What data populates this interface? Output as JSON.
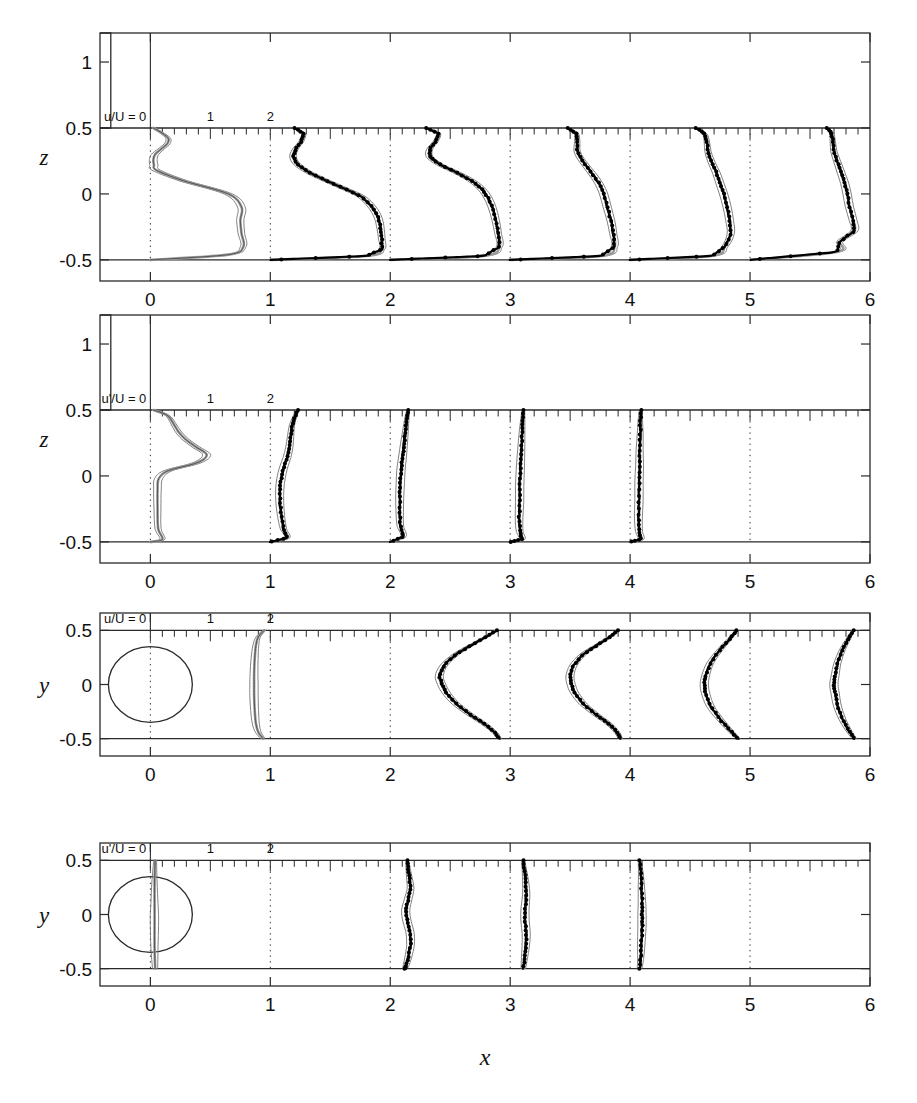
{
  "figure": {
    "title": "",
    "xlabel": "x",
    "x_axis": {
      "min": -0.42,
      "max": 6.0,
      "ticks": [
        0,
        1,
        2,
        3,
        4,
        5,
        6
      ],
      "tick_labels": [
        "0",
        "1",
        "2",
        "3",
        "4",
        "5",
        "6"
      ]
    },
    "stations": [
      0,
      1,
      2,
      3,
      4,
      5
    ],
    "profile_unit_width": 0.5
  },
  "panels": [
    {
      "id": "panel-1",
      "ylabel": "z",
      "scale_label": "u/U = 0",
      "scale_ticks": [
        "1",
        "2"
      ],
      "quantity": "u/U",
      "plane": "xz",
      "y_axis": {
        "min": -0.66,
        "max": 1.22,
        "ticks": [
          -0.5,
          0,
          0.5,
          1
        ],
        "tick_labels": [
          "-0.5",
          "0",
          "0.5",
          "1"
        ]
      },
      "wall_lines": [
        0.5,
        -0.5
      ],
      "body": {
        "type": "step",
        "x_left": -0.42,
        "x_right": -0.33,
        "z_top": 1.22,
        "z_bottom": 0.5
      },
      "has_symbols": true
    },
    {
      "id": "panel-2",
      "ylabel": "z",
      "scale_label": "u'/U = 0",
      "scale_ticks": [
        "1",
        "2"
      ],
      "quantity": "u'/U",
      "plane": "xz",
      "y_axis": {
        "min": -0.66,
        "max": 1.22,
        "ticks": [
          -0.5,
          0,
          0.5,
          1
        ],
        "tick_labels": [
          "-0.5",
          "0",
          "0.5",
          "1"
        ]
      },
      "wall_lines": [
        0.5,
        -0.5
      ],
      "body": {
        "type": "step",
        "x_left": -0.42,
        "x_right": -0.33,
        "z_top": 1.22,
        "z_bottom": 0.5
      },
      "has_symbols": true
    },
    {
      "id": "panel-3",
      "ylabel": "y",
      "scale_label": "u/U = 0",
      "scale_ticks": [
        "1",
        "2"
      ],
      "quantity": "u/U",
      "plane": "xy",
      "y_axis": {
        "min": -0.66,
        "max": 0.66,
        "ticks": [
          -0.5,
          0,
          0.5
        ],
        "tick_labels": [
          "-0.5",
          "0",
          "0.5"
        ]
      },
      "wall_lines": [
        0.5,
        -0.5
      ],
      "body": {
        "type": "circle",
        "cx": 0,
        "cy": 0,
        "r": 0.35
      },
      "has_symbols": true
    },
    {
      "id": "panel-4",
      "ylabel": "y",
      "scale_label": "u'/U = 0",
      "scale_ticks": [
        "1",
        "2"
      ],
      "quantity": "u'/U",
      "plane": "xy",
      "y_axis": {
        "min": -0.66,
        "max": 0.66,
        "ticks": [
          -0.5,
          0,
          0.5
        ],
        "tick_labels": [
          "-0.5",
          "0",
          "0.5"
        ]
      },
      "wall_lines": [
        0.5,
        -0.5
      ],
      "body": {
        "type": "circle",
        "cx": 0,
        "cy": 0,
        "r": 0.35
      },
      "has_symbols": true
    }
  ],
  "chart_data": {
    "type": "line",
    "title": "",
    "xlabel": "x",
    "ylabel": "z / y",
    "xlim": [
      -0.42,
      6.0
    ],
    "grid": false,
    "legend": "none",
    "profile_scale": "0.5 x-units per 1 unit of u/U",
    "panels": [
      {
        "name": "u/U vertical plane",
        "ylabel": "z",
        "ylim": [
          -0.66,
          1.22
        ],
        "yticks": [
          -0.5,
          0,
          0.5,
          1
        ],
        "stations": [
          {
            "x": 0,
            "z": [
              0.5,
              0.46,
              0.42,
              0.38,
              0.34,
              0.3,
              0.26,
              0.22,
              0.18,
              0.1,
              0.0,
              -0.1,
              -0.2,
              -0.3,
              -0.4,
              -0.46,
              -0.5
            ],
            "u_over_U": [
              0.05,
              0.2,
              0.3,
              0.28,
              0.18,
              0.08,
              0.05,
              0.06,
              0.1,
              0.55,
              1.3,
              1.52,
              1.5,
              1.52,
              1.55,
              1.3,
              0.0
            ],
            "series": "simulation"
          },
          {
            "x": 1,
            "z": [
              0.5,
              0.46,
              0.4,
              0.34,
              0.28,
              0.22,
              0.16,
              0.1,
              0.04,
              -0.02,
              -0.1,
              -0.18,
              -0.26,
              -0.34,
              -0.42,
              -0.47,
              -0.5
            ],
            "u_over_U": [
              0.4,
              0.55,
              0.52,
              0.42,
              0.38,
              0.46,
              0.66,
              0.94,
              1.24,
              1.52,
              1.7,
              1.8,
              1.84,
              1.86,
              1.86,
              1.6,
              0.0
            ],
            "series": "simulation+experiment"
          },
          {
            "x": 2,
            "z": [
              0.5,
              0.46,
              0.4,
              0.34,
              0.28,
              0.22,
              0.16,
              0.1,
              0.04,
              -0.02,
              -0.1,
              -0.2,
              -0.3,
              -0.4,
              -0.47,
              -0.5
            ],
            "u_over_U": [
              0.6,
              0.8,
              0.76,
              0.66,
              0.66,
              0.84,
              1.12,
              1.36,
              1.52,
              1.62,
              1.7,
              1.76,
              1.8,
              1.82,
              1.56,
              0.0
            ],
            "series": "simulation+experiment"
          },
          {
            "x": 3,
            "z": [
              0.5,
              0.46,
              0.4,
              0.32,
              0.24,
              0.16,
              0.08,
              0.0,
              -0.1,
              -0.2,
              -0.3,
              -0.4,
              -0.47,
              -0.5
            ],
            "u_over_U": [
              0.96,
              1.1,
              1.12,
              1.12,
              1.22,
              1.36,
              1.48,
              1.56,
              1.62,
              1.68,
              1.72,
              1.74,
              1.52,
              0.0
            ],
            "series": "simulation+experiment"
          },
          {
            "x": 4,
            "z": [
              0.5,
              0.46,
              0.4,
              0.32,
              0.24,
              0.16,
              0.08,
              0.0,
              -0.1,
              -0.2,
              -0.3,
              -0.4,
              -0.47,
              -0.5
            ],
            "u_over_U": [
              1.1,
              1.24,
              1.28,
              1.3,
              1.36,
              1.44,
              1.5,
              1.56,
              1.62,
              1.66,
              1.68,
              1.58,
              1.36,
              0.0
            ],
            "series": "simulation+experiment"
          },
          {
            "x": 5,
            "z": [
              0.5,
              0.46,
              0.4,
              0.32,
              0.24,
              0.16,
              0.08,
              0.0,
              -0.1,
              -0.2,
              -0.28,
              -0.36,
              -0.44,
              -0.5
            ],
            "u_over_U": [
              1.28,
              1.36,
              1.38,
              1.4,
              1.46,
              1.52,
              1.58,
              1.62,
              1.66,
              1.72,
              1.74,
              1.5,
              1.44,
              0.0
            ],
            "series": "simulation+experiment"
          }
        ]
      },
      {
        "name": "u'/U vertical plane",
        "ylabel": "z",
        "ylim": [
          -0.66,
          1.22
        ],
        "yticks": [
          -0.5,
          0,
          0.5,
          1
        ],
        "stations": [
          {
            "x": 0,
            "z": [
              0.5,
              0.46,
              0.4,
              0.34,
              0.28,
              0.22,
              0.16,
              0.1,
              0.04,
              -0.02,
              -0.1,
              -0.25,
              -0.4,
              -0.48,
              -0.5
            ],
            "u_rms_over_U": [
              0.05,
              0.28,
              0.38,
              0.46,
              0.58,
              0.76,
              0.94,
              0.78,
              0.3,
              0.14,
              0.12,
              0.12,
              0.13,
              0.2,
              0.0
            ],
            "series": "simulation"
          },
          {
            "x": 1,
            "z": [
              0.5,
              0.44,
              0.38,
              0.3,
              0.22,
              0.14,
              0.06,
              -0.02,
              -0.1,
              -0.2,
              -0.3,
              -0.4,
              -0.47,
              -0.5
            ],
            "u_rms_over_U": [
              0.46,
              0.4,
              0.36,
              0.34,
              0.32,
              0.28,
              0.22,
              0.18,
              0.16,
              0.16,
              0.18,
              0.22,
              0.28,
              0.0
            ],
            "series": "simulation+experiment"
          },
          {
            "x": 2,
            "z": [
              0.5,
              0.44,
              0.36,
              0.28,
              0.2,
              0.12,
              0.04,
              -0.06,
              -0.16,
              -0.28,
              -0.38,
              -0.46,
              -0.5
            ],
            "u_rms_over_U": [
              0.3,
              0.28,
              0.26,
              0.24,
              0.22,
              0.2,
              0.18,
              0.17,
              0.16,
              0.16,
              0.17,
              0.22,
              0.0
            ],
            "series": "simulation+experiment"
          },
          {
            "x": 3,
            "z": [
              0.5,
              0.42,
              0.34,
              0.24,
              0.14,
              0.04,
              -0.08,
              -0.2,
              -0.32,
              -0.42,
              -0.48,
              -0.5
            ],
            "u_rms_over_U": [
              0.22,
              0.21,
              0.2,
              0.19,
              0.18,
              0.17,
              0.16,
              0.16,
              0.15,
              0.16,
              0.2,
              0.0
            ],
            "series": "simulation+experiment"
          },
          {
            "x": 4,
            "z": [
              0.5,
              0.42,
              0.32,
              0.2,
              0.08,
              -0.04,
              -0.18,
              -0.32,
              -0.42,
              -0.48,
              -0.5
            ],
            "u_rms_over_U": [
              0.18,
              0.17,
              0.17,
              0.16,
              0.16,
              0.15,
              0.15,
              0.14,
              0.15,
              0.18,
              0.0
            ],
            "series": "simulation+experiment"
          }
        ]
      },
      {
        "name": "u/U horizontal plane",
        "ylabel": "y",
        "ylim": [
          -0.66,
          0.66
        ],
        "yticks": [
          -0.5,
          0,
          0.5
        ],
        "stations": [
          {
            "x": 0,
            "y": [
              0.5,
              0.44,
              0.36,
              0.24,
              0.1,
              0.0,
              -0.1,
              -0.24,
              -0.36,
              -0.44,
              -0.5
            ],
            "u_over_U": [
              1.9,
              1.8,
              1.76,
              1.74,
              1.73,
              1.73,
              1.73,
              1.74,
              1.76,
              1.8,
              1.88
            ],
            "series": "simulation"
          },
          {
            "x": 2,
            "y": [
              0.5,
              0.44,
              0.36,
              0.28,
              0.18,
              0.08,
              0.0,
              -0.08,
              -0.18,
              -0.28,
              -0.36,
              -0.44,
              -0.5
            ],
            "u_over_U": [
              1.78,
              1.6,
              1.34,
              1.1,
              0.9,
              0.82,
              0.86,
              0.94,
              1.1,
              1.34,
              1.56,
              1.74,
              1.82
            ],
            "series": "simulation+experiment"
          },
          {
            "x": 3,
            "y": [
              0.5,
              0.44,
              0.36,
              0.28,
              0.18,
              0.08,
              0.0,
              -0.08,
              -0.18,
              -0.28,
              -0.36,
              -0.44,
              -0.5
            ],
            "u_over_U": [
              1.8,
              1.66,
              1.44,
              1.22,
              1.06,
              1.0,
              1.02,
              1.08,
              1.22,
              1.44,
              1.64,
              1.78,
              1.84
            ],
            "series": "simulation+experiment"
          },
          {
            "x": 4,
            "y": [
              0.5,
              0.42,
              0.32,
              0.2,
              0.08,
              0.0,
              -0.08,
              -0.2,
              -0.32,
              -0.42,
              -0.5
            ],
            "u_over_U": [
              1.78,
              1.66,
              1.5,
              1.34,
              1.26,
              1.24,
              1.26,
              1.34,
              1.5,
              1.66,
              1.8
            ],
            "series": "simulation+experiment"
          },
          {
            "x": 5,
            "y": [
              0.5,
              0.42,
              0.32,
              0.2,
              0.08,
              0.0,
              -0.08,
              -0.2,
              -0.32,
              -0.42,
              -0.5
            ],
            "u_over_U": [
              1.72,
              1.64,
              1.54,
              1.46,
              1.42,
              1.4,
              1.42,
              1.46,
              1.54,
              1.64,
              1.74
            ],
            "series": "simulation+experiment"
          }
        ]
      },
      {
        "name": "u'/U horizontal plane",
        "ylabel": "y",
        "ylim": [
          -0.66,
          0.66
        ],
        "yticks": [
          -0.5,
          0,
          0.5
        ],
        "stations": [
          {
            "x": 0,
            "y": [
              0.5,
              0.3,
              0.1,
              0.0,
              -0.1,
              -0.3,
              -0.5
            ],
            "u_rms_over_U": [
              0.08,
              0.07,
              0.07,
              0.07,
              0.07,
              0.07,
              0.08
            ],
            "series": "simulation"
          },
          {
            "x": 2,
            "y": [
              0.5,
              0.42,
              0.34,
              0.24,
              0.14,
              0.04,
              -0.06,
              -0.16,
              -0.28,
              -0.4,
              -0.48,
              -0.5
            ],
            "u_rms_over_U": [
              0.28,
              0.3,
              0.32,
              0.34,
              0.3,
              0.26,
              0.28,
              0.33,
              0.34,
              0.3,
              0.26,
              0.24
            ],
            "series": "simulation+experiment"
          },
          {
            "x": 3,
            "y": [
              0.5,
              0.4,
              0.3,
              0.18,
              0.06,
              -0.06,
              -0.18,
              -0.3,
              -0.4,
              -0.5
            ],
            "u_rms_over_U": [
              0.22,
              0.24,
              0.26,
              0.27,
              0.25,
              0.25,
              0.27,
              0.26,
              0.24,
              0.22
            ],
            "series": "simulation+experiment"
          },
          {
            "x": 4,
            "y": [
              0.5,
              0.38,
              0.24,
              0.1,
              0.0,
              -0.1,
              -0.24,
              -0.38,
              -0.5
            ],
            "u_rms_over_U": [
              0.16,
              0.18,
              0.19,
              0.2,
              0.2,
              0.2,
              0.19,
              0.18,
              0.16
            ],
            "series": "simulation+experiment"
          }
        ]
      }
    ]
  }
}
